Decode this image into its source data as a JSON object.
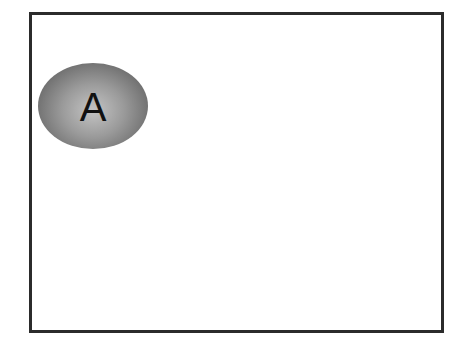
{
  "diagram": {
    "frame": {
      "border_color": "#2b2b2b",
      "background": "#ffffff"
    },
    "nodes": [
      {
        "id": "A",
        "label": "A",
        "shape": "ellipse",
        "fill": "radial-gray-gradient"
      }
    ]
  }
}
